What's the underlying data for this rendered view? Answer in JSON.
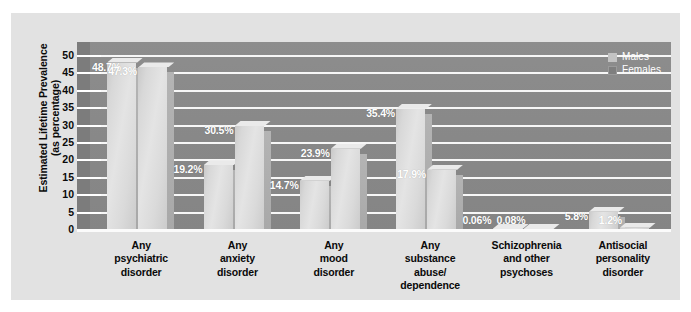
{
  "chart_data": {
    "type": "bar",
    "title": "",
    "subtitle": "",
    "xlabel": "",
    "ylabel_lines": [
      "Estimated Lifetime Prevalence",
      "(as percentage)"
    ],
    "ylabel": "Estimated Lifetime Prevalence (as percentage)",
    "ylim": [
      0,
      50
    ],
    "ytick_labels": [
      "50",
      "45",
      "40",
      "35",
      "30",
      "25",
      "20",
      "15",
      "10",
      "5",
      "0"
    ],
    "yticks": [
      50,
      45,
      40,
      35,
      30,
      25,
      20,
      15,
      10,
      5,
      0
    ],
    "grid": true,
    "legend_position": "top-right",
    "categories": [
      "Any\npsychiatric\ndisorder",
      "Any\nanxiety\ndisorder",
      "Any\nmood\ndisorder",
      "Any\nsubstance\nabuse/\ndependence",
      "Schizophrenia\nand other\npsychoses",
      "Antisocial\npersonality\ndisorder"
    ],
    "category_lines": [
      [
        "Any",
        "psychiatric",
        "disorder"
      ],
      [
        "Any",
        "anxiety",
        "disorder"
      ],
      [
        "Any",
        "mood",
        "disorder"
      ],
      [
        "Any",
        "substance",
        "abuse/",
        "dependence"
      ],
      [
        "Schizophrenia",
        "and other",
        "psychoses"
      ],
      [
        "Antisocial",
        "personality",
        "disorder"
      ]
    ],
    "series": [
      {
        "name": "Males",
        "values": [
          48.7,
          19.2,
          14.7,
          35.4,
          0.06,
          5.8
        ],
        "labels": [
          "48.7%",
          "19.2%",
          "14.7%",
          "35.4%",
          "0.06%",
          "5.8%"
        ]
      },
      {
        "name": "Females",
        "values": [
          47.3,
          30.5,
          23.9,
          17.9,
          0.08,
          1.2
        ],
        "labels": [
          "47.3%",
          "30.5%",
          "23.9%",
          "17.9%",
          "0.08%",
          "1.2%"
        ]
      }
    ]
  },
  "legend": {
    "items": [
      {
        "label": "Males",
        "swatch": "males",
        "color": "#c3c3c3"
      },
      {
        "label": "Females",
        "swatch": "females",
        "color": "#7f7f7f"
      }
    ]
  },
  "colors": {
    "card_background": "#e2e2e2",
    "plot_background": "#888888",
    "gridline": "#f7f7f7",
    "bar_fill": "#dcdcdc",
    "bar_side": "#aeaeae",
    "value_text": "#ffffff",
    "axis_text": "#0a0a0a"
  }
}
